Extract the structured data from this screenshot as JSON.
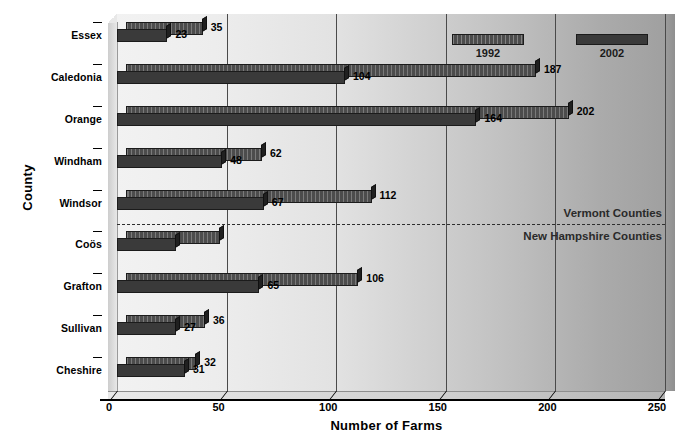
{
  "chart_data": {
    "type": "bar",
    "orientation": "horizontal",
    "title": "",
    "xlabel": "Number of Farms",
    "ylabel": "County",
    "xlim": [
      0,
      250
    ],
    "xticks": [
      0,
      50,
      100,
      150,
      200,
      250
    ],
    "grid": true,
    "legend_position": "top-right",
    "categories": [
      "Essex",
      "Caledonia",
      "Orange",
      "Windham",
      "Windsor",
      "Coös",
      "Grafton",
      "Sullivan",
      "Cheshire"
    ],
    "series": [
      {
        "name": "1992",
        "values": [
          35,
          187,
          202,
          62,
          112,
          43,
          106,
          36,
          32
        ]
      },
      {
        "name": "2002",
        "values": [
          23,
          104,
          164,
          48,
          67,
          27,
          65,
          27,
          31
        ]
      }
    ],
    "annotations": [
      {
        "text": "Vermont Counties",
        "applies_to": [
          "Essex",
          "Caledonia",
          "Orange",
          "Windham",
          "Windsor"
        ]
      },
      {
        "text": "New Hampshire Counties",
        "applies_to": [
          "Coös",
          "Grafton",
          "Sullivan",
          "Cheshire"
        ]
      }
    ]
  },
  "axes": {
    "y_title": "County",
    "x_title": "Number of Farms",
    "x_tick_labels": [
      "0",
      "50",
      "100",
      "150",
      "200",
      "250"
    ],
    "category_labels": [
      "Essex",
      "Caledonia",
      "Orange",
      "Windham",
      "Windsor",
      "Coös",
      "Grafton",
      "Sullivan",
      "Cheshire"
    ]
  },
  "legend": {
    "entries": [
      {
        "label": "1992",
        "color": "#4c4c4c",
        "pattern": "striped"
      },
      {
        "label": "2002",
        "color": "#3a3a3a",
        "pattern": "solid"
      }
    ]
  },
  "regions": {
    "upper_label": "Vermont Counties",
    "lower_label": "New Hampshire Counties"
  },
  "values": {
    "essex_1992": "35",
    "essex_2002": "23",
    "caledonia_1992": "187",
    "caledonia_2002": "104",
    "orange_1992": "202",
    "orange_2002": "164",
    "windham_1992": "62",
    "windham_2002": "48",
    "windsor_1992": "112",
    "windsor_2002": "67",
    "coos_1992": "43",
    "coos_2002": "27",
    "grafton_1992": "106",
    "grafton_2002": "65",
    "sullivan_1992": "36",
    "sullivan_2002": "27",
    "cheshire_1992": "32",
    "cheshire_2002": "31"
  },
  "colors": {
    "series_1992": "#4c4c4c",
    "series_2002": "#3a3a3a",
    "background_light": "#f2f2f2",
    "background_dark": "#a0a0a0",
    "text": "#000000"
  }
}
